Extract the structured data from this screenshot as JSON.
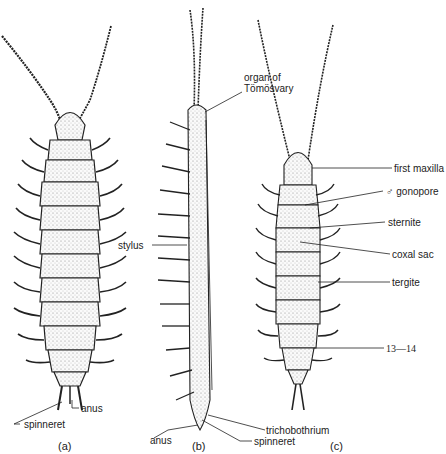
{
  "figure": {
    "panels": [
      {
        "id": "a",
        "caption": "(a)",
        "view": "dorsal view",
        "labels": [
          {
            "key": "anus",
            "text": "anus"
          },
          {
            "key": "spinneret",
            "text": "spinneret"
          }
        ]
      },
      {
        "id": "b",
        "caption": "(b)",
        "view": "lateral view",
        "labels": [
          {
            "key": "organ_of_tomosvary_line1",
            "text": "organ of"
          },
          {
            "key": "organ_of_tomosvary_line2",
            "text": "Tömösvary"
          },
          {
            "key": "stylus",
            "text": "stylus"
          },
          {
            "key": "anus",
            "text": "anus"
          },
          {
            "key": "trichobothrium",
            "text": "trichobothrium"
          },
          {
            "key": "spinneret",
            "text": "spinneret"
          }
        ]
      },
      {
        "id": "c",
        "caption": "(c)",
        "view": "ventral view",
        "labels": [
          {
            "key": "first_maxilla",
            "text": "first maxilla"
          },
          {
            "key": "gonopore",
            "text": "♂ gonopore"
          },
          {
            "key": "sternite",
            "text": "sternite"
          },
          {
            "key": "coxal_sac",
            "text": "coxal sac"
          },
          {
            "key": "tergite",
            "text": "tergite"
          },
          {
            "key": "segments",
            "text": "13—14"
          }
        ]
      }
    ]
  }
}
